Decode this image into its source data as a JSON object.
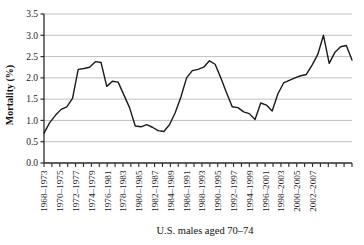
{
  "chart_data": {
    "type": "line",
    "title": "",
    "xlabel": "U.S. males aged 70–74",
    "ylabel": "Mortality (%)",
    "ylim": [
      0.0,
      3.5
    ],
    "ytick_labels": [
      "0.0",
      "0.5",
      "1.0",
      "1.5",
      "2.0",
      "2.5",
      "3.0",
      "3.5"
    ],
    "ytick_values": [
      0.0,
      0.5,
      1.0,
      1.5,
      2.0,
      2.5,
      3.0,
      3.5
    ],
    "grid": "horizontal",
    "legend": "none",
    "x_tick_count": 40,
    "xtick_labels": [
      "1968–1973",
      "1970–1975",
      "1972–1977",
      "1974–1979",
      "1976–1981",
      "1978–1983",
      "1980–1985",
      "1982–1987",
      "1984–1989",
      "1986–1991",
      "1988–1993",
      "1990–1995",
      "1992–1997",
      "1994–1999",
      "1996–2001",
      "1998–2003",
      "2000–2005",
      "2002–2007"
    ],
    "x_labels_every_nth_tick": 2,
    "categories": [
      "1968–1973",
      "1969–1974",
      "1970–1975",
      "1971–1976",
      "1972–1977",
      "1973–1978",
      "1974–1979",
      "1975–1980",
      "1976–1981",
      "1977–1982",
      "1978–1983",
      "1979–1984",
      "1980–1985",
      "1981–1986",
      "1982–1987",
      "1983–1988",
      "1984–1989",
      "1985–1990",
      "1986–1991",
      "1987–1992",
      "1988–1993",
      "1989–1994",
      "1990–1995",
      "1991–1996",
      "1992–1997",
      "1993–1998",
      "1994–1999",
      "1995–2000",
      "1996–2001",
      "1997–2002",
      "1998–2003",
      "1999–2004",
      "2000–2005",
      "2001–2006",
      "2002–2007",
      "2003–2008",
      "2004–2009",
      "2005–2010",
      "2006–2011",
      "2007–2012"
    ],
    "values": [
      0.7,
      0.95,
      1.12,
      1.26,
      1.32,
      1.52,
      2.2,
      2.22,
      2.25,
      2.38,
      2.36,
      1.8,
      1.92,
      1.9,
      1.6,
      1.3,
      0.87,
      0.85,
      0.9,
      0.84,
      0.76,
      0.74,
      0.9,
      1.18,
      1.55,
      2.0,
      2.17,
      2.2,
      2.25,
      2.4,
      2.32,
      2.0,
      1.65,
      1.32,
      1.3,
      1.2,
      1.16,
      1.02,
      1.41,
      1.36
    ],
    "values_tail": [
      1.22,
      1.62,
      1.88,
      1.94,
      2.0,
      2.05,
      2.08,
      2.3,
      2.55,
      3.0,
      2.34,
      2.6,
      2.73,
      2.76,
      2.42
    ],
    "line_color": "#1a1a1a",
    "line_width": 1.4,
    "grid_color": "#b8b8b8",
    "axis_color": "#2b2b2b",
    "background": "#ffffff"
  }
}
